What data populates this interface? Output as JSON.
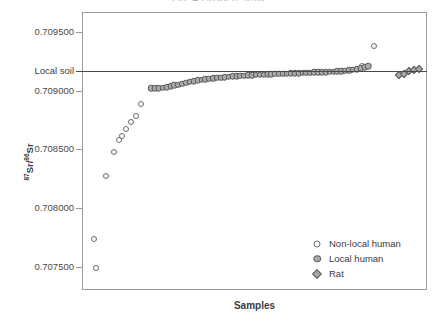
{
  "figure": {
    "clipped_title": "Fig. 4  Gosden Strait",
    "xaxis_title": "Samples",
    "yaxis_title_pre": "87",
    "yaxis_title_mid": "Sr/",
    "yaxis_title_sup2": "86",
    "yaxis_title_end": "Sr",
    "reference_label": "Local soil"
  },
  "legend": {
    "position": "bottom-right",
    "entries": [
      {
        "label": "Non-local human",
        "marker": "open-circle",
        "color": "#ffffff"
      },
      {
        "label": "Local human",
        "marker": "filled-circle",
        "color": "#a9a9a9"
      },
      {
        "label": "Rat",
        "marker": "filled-diamond",
        "color": "#a9a9a9"
      }
    ]
  },
  "colors": {
    "frame": "#9a9a9a",
    "soil_line": "#4a4a4a",
    "marker_outline": "#585858",
    "marker_fill": "#a9a9a9",
    "open_marker_fill": "#ffffff",
    "text": "#3b3b3b"
  },
  "chart_data": {
    "type": "scatter",
    "title": "Fig. 4  Gosden Strait",
    "xlabel": "Samples",
    "ylabel": "87Sr/86Sr",
    "grid": false,
    "legend_position": "lower right",
    "ylim": [
      0.7073,
      0.70967
    ],
    "ytick_labels": [
      "0.709500",
      "0.709000",
      "0.708500",
      "0.708000",
      "0.707500"
    ],
    "yticks": [
      0.7095,
      0.709,
      0.7085,
      0.708,
      0.7075
    ],
    "xlim": [
      0,
      80
    ],
    "xticks": [],
    "annotations": [
      {
        "type": "horizontal-line",
        "label": "Local soil",
        "value": 0.709165,
        "color": "#4a4a4a"
      }
    ],
    "series": [
      {
        "name": "Non-local human",
        "marker": "open-circle",
        "x": [
          2.9,
          2.6,
          5.4,
          7.2,
          8.3,
          9.1,
          9.9,
          11.2,
          12.2,
          13.4,
          64.6,
          67.4
        ],
        "values": [
          0.707499,
          0.707745,
          0.708277,
          0.708488,
          0.708587,
          0.708625,
          0.70868,
          0.70874,
          0.708796,
          0.708896,
          0.709221,
          0.709387
        ]
      },
      {
        "name": "Local human",
        "marker": "filled-circle",
        "x": [
          15.8,
          16.7,
          17.6,
          18.5,
          19.4,
          20.3,
          21.2,
          22.1,
          23.0,
          23.9,
          24.8,
          25.7,
          26.6,
          27.5,
          28.4,
          29.3,
          30.2,
          31.1,
          32.0,
          32.9,
          33.8,
          34.7,
          35.6,
          36.5,
          37.4,
          38.3,
          39.2,
          40.1,
          41.0,
          41.9,
          42.8,
          43.7,
          44.6,
          45.5,
          46.4,
          47.3,
          48.2,
          49.1,
          50.0,
          50.9,
          51.8,
          52.7,
          53.6,
          54.5,
          55.4,
          56.3,
          57.2,
          58.1,
          59.0,
          59.9,
          60.8,
          61.7,
          62.6,
          63.5,
          64.4,
          65.3,
          66.2
        ],
        "values": [
          0.709027,
          0.709028,
          0.70903,
          0.709032,
          0.709039,
          0.709045,
          0.709052,
          0.70906,
          0.709068,
          0.709076,
          0.709083,
          0.709089,
          0.709095,
          0.7091,
          0.709105,
          0.709109,
          0.709113,
          0.709117,
          0.70912,
          0.709123,
          0.709126,
          0.709129,
          0.709131,
          0.709134,
          0.709136,
          0.709138,
          0.70914,
          0.709142,
          0.709144,
          0.709145,
          0.709147,
          0.709148,
          0.70915,
          0.709151,
          0.709153,
          0.709154,
          0.709155,
          0.709157,
          0.709158,
          0.709159,
          0.70916,
          0.709162,
          0.709163,
          0.709164,
          0.709166,
          0.709167,
          0.709169,
          0.70917,
          0.709172,
          0.709174,
          0.709176,
          0.70918,
          0.709185,
          0.709192,
          0.7092,
          0.709209,
          0.709217
        ]
      },
      {
        "name": "Rat",
        "marker": "filled-diamond",
        "x": [
          73.2,
          74.4,
          75.6,
          76.8,
          78.0
        ],
        "values": [
          0.709145,
          0.709152,
          0.709176,
          0.709188,
          0.709193
        ]
      }
    ]
  }
}
